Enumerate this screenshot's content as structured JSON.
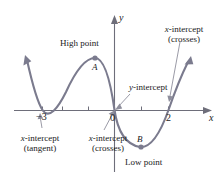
{
  "figure": {
    "kind": "cartesian-graph",
    "colors": {
      "curve": "#7b7b8e",
      "axis": "#6e6e7a",
      "leader": "#9a9aa6",
      "text": "#1a1a1a",
      "point": "#7b7b8e",
      "background": "#ffffff"
    }
  },
  "axes": {
    "x_label": "x",
    "y_label": "y",
    "origin_label": "0",
    "x_ticks": [
      {
        "label": "−3",
        "value": -3,
        "show_label": true
      },
      {
        "label": "",
        "value": -2,
        "show_label": false
      },
      {
        "label": "",
        "value": -1,
        "show_label": false
      },
      {
        "label": "",
        "value": 1,
        "show_label": false
      },
      {
        "label": "2",
        "value": 2,
        "show_label": true
      }
    ]
  },
  "annotations": [
    {
      "id": "high-point",
      "text": "High point",
      "kind": "extremum"
    },
    {
      "id": "point-a",
      "text": "A",
      "kind": "point-label"
    },
    {
      "id": "low-point",
      "text": "Low point",
      "kind": "extremum"
    },
    {
      "id": "point-b",
      "text": "B",
      "kind": "point-label"
    },
    {
      "id": "x-intercept-tangent",
      "line1": "x-intercept",
      "line2": "(tangent)",
      "kind": "intercept"
    },
    {
      "id": "x-intercept-crosses-origin",
      "line1": "x-intercept",
      "line2": "(crosses)",
      "kind": "intercept"
    },
    {
      "id": "x-intercept-crosses-right",
      "line1": "x-intercept",
      "line2": "(crosses)",
      "kind": "intercept"
    },
    {
      "id": "y-intercept",
      "text": "y-intercept",
      "kind": "intercept"
    }
  ],
  "labels": {
    "high_point": "High point",
    "low_point": "Low point",
    "point_a": "A",
    "point_b": "B",
    "x_axis": "x",
    "y_axis": "y",
    "origin": "0",
    "tick_neg3": "−3",
    "tick_2": "2",
    "xint_tangent_line1": "x-intercept",
    "xint_tangent_line2": "(tangent)",
    "xint_origin_line1": "x-intercept",
    "xint_origin_line2": "(crosses)",
    "xint_right_line1": "x-intercept",
    "xint_right_line2": "(crosses)",
    "y_intercept": "y-intercept",
    "italic_x": "x",
    "italic_y": "y",
    "dash_intercept": "-intercept"
  },
  "chart_data": {
    "type": "line",
    "title": "",
    "xlabel": "x",
    "ylabel": "y",
    "grid": false,
    "legend": null,
    "xlim": [
      -4.3,
      3.0
    ],
    "roots": [
      -3,
      0,
      2
    ],
    "root_behavior": [
      "tangent",
      "crosses",
      "crosses"
    ],
    "extrema": [
      {
        "name": "A",
        "type": "maximum",
        "label": "High point"
      },
      {
        "name": "B",
        "type": "minimum",
        "label": "Low point"
      }
    ],
    "y_intercept": 0
  }
}
